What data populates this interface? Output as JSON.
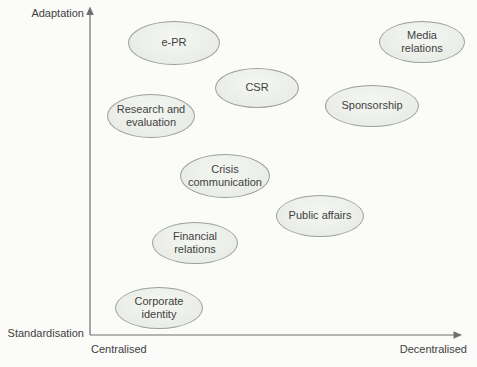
{
  "figure": {
    "colors": {
      "background": "#fbfbf9",
      "ellipse_fill": "#e9ece6",
      "ellipse_highlight": "#f4f6f2",
      "ellipse_border": "#9aa09b",
      "axis": "#6f6f6f",
      "text": "#3f3f3f"
    },
    "y_axis": {
      "top_label": "Adaptation",
      "bottom_label": "Standardisation"
    },
    "x_axis": {
      "left_label": "Centralised",
      "right_label": "Decentralised"
    },
    "bubbles": [
      {
        "label": "e-PR",
        "lines": [
          "e-PR"
        ],
        "x": 174,
        "y": 43,
        "rx": 46,
        "ry": 22
      },
      {
        "label": "Media relations",
        "lines": [
          "Media",
          "relations"
        ],
        "x": 422,
        "y": 42,
        "rx": 43,
        "ry": 21
      },
      {
        "label": "CSR",
        "lines": [
          "CSR"
        ],
        "x": 257,
        "y": 88,
        "rx": 42,
        "ry": 20
      },
      {
        "label": "Research and evaluation",
        "lines": [
          "Research and",
          "evaluation"
        ],
        "x": 151,
        "y": 116,
        "rx": 44,
        "ry": 22
      },
      {
        "label": "Sponsorship",
        "lines": [
          "Sponsorship"
        ],
        "x": 372,
        "y": 106,
        "rx": 47,
        "ry": 21
      },
      {
        "label": "Crisis communication",
        "lines": [
          "Crisis",
          "communication"
        ],
        "x": 225,
        "y": 176,
        "rx": 45,
        "ry": 22
      },
      {
        "label": "Public affairs",
        "lines": [
          "Public affairs"
        ],
        "x": 320,
        "y": 216,
        "rx": 44,
        "ry": 21
      },
      {
        "label": "Financial relations",
        "lines": [
          "Financial",
          "relations"
        ],
        "x": 195,
        "y": 243,
        "rx": 43,
        "ry": 21
      },
      {
        "label": "Corporate identity",
        "lines": [
          "Corporate",
          "identity"
        ],
        "x": 159,
        "y": 308,
        "rx": 44,
        "ry": 21
      }
    ]
  }
}
